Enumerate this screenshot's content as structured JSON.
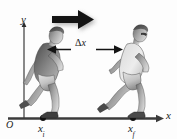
{
  "figure": {
    "kind": "physics-displacement-diagram",
    "background_color": "#fdfdfd",
    "ink_color": "#1a1a1a",
    "axes": {
      "y_label": "y",
      "x_label": "x",
      "origin_label": "O"
    },
    "markers": {
      "initial": {
        "label_base": "x",
        "label_sub": "i"
      },
      "final": {
        "label_base": "x",
        "label_sub": "f"
      }
    },
    "measurement": {
      "delta_symbol": "Δ",
      "delta_variable": "x",
      "arrow_style": "double-headed"
    },
    "motion_arrow": {
      "name": "direction-of-motion-arrow",
      "direction": "right",
      "color": "#111111"
    },
    "subjects": [
      {
        "name": "runner-initial-position",
        "pose": "running",
        "tone": "grayscale"
      },
      {
        "name": "runner-final-position",
        "pose": "running",
        "tone": "grayscale"
      }
    ]
  }
}
